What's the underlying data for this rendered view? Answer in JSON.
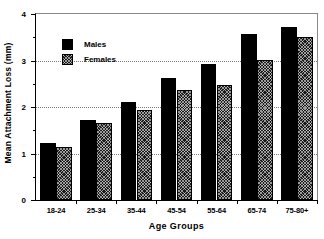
{
  "chart_data": {
    "type": "bar",
    "title": "",
    "xlabel": "Age  Groups",
    "ylabel": "Mean  Attachment  Loss  (mm)",
    "categories": [
      "18-24",
      "25-34",
      "35-44",
      "45-54",
      "55-64",
      "65-74",
      "75-80+"
    ],
    "series": [
      {
        "name": "Males",
        "values": [
          1.22,
          1.72,
          2.1,
          2.63,
          2.93,
          3.56,
          3.72
        ]
      },
      {
        "name": "Females",
        "values": [
          1.13,
          1.66,
          1.93,
          2.37,
          2.47,
          3.01,
          3.5
        ]
      }
    ],
    "ylim": [
      0,
      4
    ],
    "yticks": [
      0,
      1,
      2,
      3,
      4
    ],
    "ytick_labels": [
      "0",
      "1",
      "2",
      "3",
      "4"
    ],
    "yminor_ticks": [
      0.5,
      1.5,
      2.5,
      3.5
    ],
    "gridlines": [
      1,
      2,
      3
    ],
    "grid": true,
    "grid_style": "dotted",
    "legend_position": "upper-left-inside",
    "colors": {
      "males": "#000000",
      "females_fill": "#1a1a1a",
      "background": "#ffffff",
      "axis": "#000000",
      "grid": "#7a7a7a"
    }
  }
}
